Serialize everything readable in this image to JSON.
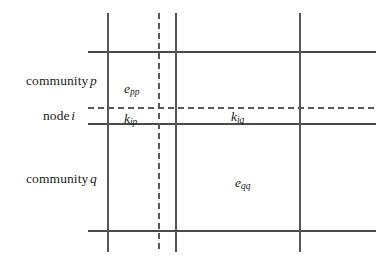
{
  "diagram": {
    "ink_color": "#3a3a3a",
    "text_color": "#1d1d1d",
    "row_labels": [
      {
        "name": "community-p",
        "text": "community",
        "symbol": "p"
      },
      {
        "name": "node-i",
        "text": "node",
        "symbol": "i"
      },
      {
        "name": "community-q",
        "text": "community",
        "symbol": "q"
      }
    ],
    "cell_labels": [
      {
        "name": "e-pp",
        "base": "e",
        "sub": "pp"
      },
      {
        "name": "k-ip",
        "base": "k",
        "sub": "ip"
      },
      {
        "name": "k-iq",
        "base": "k",
        "sub": "iq"
      },
      {
        "name": "e-qq",
        "base": "e",
        "sub": "qq"
      }
    ],
    "lines": {
      "horizontal_solid": [
        52,
        124,
        231
      ],
      "horizontal_dashed": [
        108
      ],
      "vertical_solid": [
        108,
        176,
        300
      ],
      "vertical_dashed": [
        159
      ],
      "h_span": [
        88,
        376
      ],
      "v_span": [
        13,
        252
      ]
    }
  }
}
